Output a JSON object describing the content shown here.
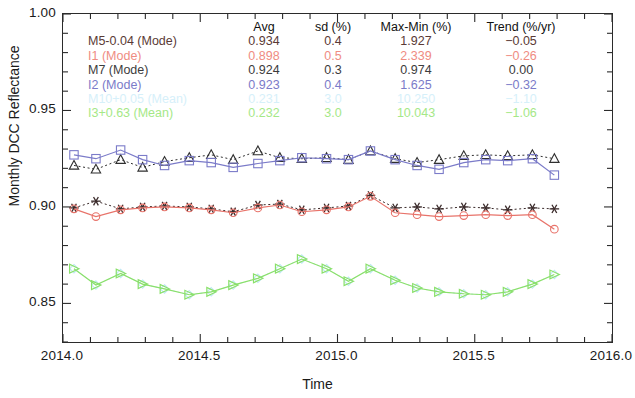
{
  "chart_data": {
    "type": "line",
    "title": "",
    "xlabel": "Time",
    "ylabel": "Monthly DCC Reflectance",
    "xlim": [
      2014.0,
      2016.0
    ],
    "ylim": [
      0.83,
      1.0
    ],
    "xticks": [
      "2014.0",
      "2014.5",
      "2015.0",
      "2015.5",
      "2016.0"
    ],
    "xtick_values": [
      2014.0,
      2014.5,
      2015.0,
      2015.5,
      2016.0
    ],
    "yticks": [
      "0.85",
      "0.90",
      "0.95",
      "1.00"
    ],
    "ytick_values": [
      0.85,
      0.9,
      0.95,
      1.0
    ],
    "grid": false,
    "legend_position": "top-center-inside",
    "series": [
      {
        "name": "M5-0.04 (Mode)",
        "color": "#3a2a2a",
        "marker": "asterisk",
        "linestyle": "dotted",
        "x": [
          2014.04,
          2014.12,
          2014.21,
          2014.29,
          2014.37,
          2014.46,
          2014.54,
          2014.62,
          2014.71,
          2014.79,
          2014.87,
          2014.96,
          2015.04,
          2015.12,
          2015.21,
          2015.29,
          2015.37,
          2015.46,
          2015.54,
          2015.62,
          2015.71,
          2015.79
        ],
        "y": [
          0.8995,
          0.903,
          0.899,
          0.9,
          0.9005,
          0.9,
          0.899,
          0.8975,
          0.901,
          0.9015,
          0.8985,
          0.8995,
          0.9005,
          0.906,
          0.8995,
          0.9,
          0.899,
          0.9,
          0.8995,
          0.8985,
          0.8995,
          0.899
        ]
      },
      {
        "name": "I1 (Mode)",
        "color": "#e8736a",
        "marker": "circle",
        "linestyle": "solid",
        "x": [
          2014.04,
          2014.12,
          2014.21,
          2014.29,
          2014.37,
          2014.46,
          2014.54,
          2014.62,
          2014.71,
          2014.79,
          2014.87,
          2014.96,
          2015.04,
          2015.12,
          2015.21,
          2015.29,
          2015.37,
          2015.46,
          2015.54,
          2015.62,
          2015.71,
          2015.79
        ],
        "y": [
          0.899,
          0.895,
          0.8985,
          0.8995,
          0.9,
          0.8995,
          0.8985,
          0.897,
          0.8995,
          0.901,
          0.8975,
          0.8985,
          0.9,
          0.9055,
          0.897,
          0.896,
          0.895,
          0.8955,
          0.896,
          0.8955,
          0.896,
          0.8885
        ]
      },
      {
        "name": "M7 (Mode)",
        "color": "#2f2f2f",
        "marker": "triangle-up",
        "linestyle": "dotted",
        "x": [
          2014.04,
          2014.12,
          2014.21,
          2014.29,
          2014.37,
          2014.46,
          2014.54,
          2014.62,
          2014.71,
          2014.79,
          2014.87,
          2014.96,
          2015.04,
          2015.12,
          2015.21,
          2015.29,
          2015.37,
          2015.46,
          2015.54,
          2015.62,
          2015.71,
          2015.79
        ],
        "y": [
          0.9215,
          0.9195,
          0.9245,
          0.9205,
          0.9235,
          0.9255,
          0.927,
          0.9245,
          0.929,
          0.9255,
          0.925,
          0.9255,
          0.9245,
          0.929,
          0.925,
          0.923,
          0.9245,
          0.9265,
          0.927,
          0.9265,
          0.927,
          0.925
        ]
      },
      {
        "name": "I2 (Mode)",
        "color": "#7b7bc9",
        "marker": "square",
        "linestyle": "solid",
        "x": [
          2014.04,
          2014.12,
          2014.21,
          2014.29,
          2014.37,
          2014.46,
          2014.54,
          2014.62,
          2014.71,
          2014.79,
          2014.87,
          2014.96,
          2015.04,
          2015.12,
          2015.21,
          2015.29,
          2015.37,
          2015.46,
          2015.54,
          2015.62,
          2015.71,
          2015.79
        ],
        "y": [
          0.927,
          0.925,
          0.9295,
          0.9245,
          0.9215,
          0.924,
          0.923,
          0.9205,
          0.9225,
          0.924,
          0.9255,
          0.925,
          0.9245,
          0.929,
          0.9245,
          0.9215,
          0.9195,
          0.923,
          0.9245,
          0.924,
          0.925,
          0.9165
        ]
      },
      {
        "name": "M10+0.05 (Mean)",
        "color": "#bfe8f5",
        "marker": "diamond",
        "linestyle": "dotted",
        "x": [
          2014.04,
          2014.12,
          2014.21,
          2014.29,
          2014.37,
          2014.46,
          2014.54,
          2014.62,
          2014.71,
          2014.79,
          2014.87,
          2014.96,
          2015.04,
          2015.12,
          2015.21,
          2015.29,
          2015.37,
          2015.46,
          2015.54,
          2015.62,
          2015.71,
          2015.79
        ],
        "y": [
          0.868,
          0.8595,
          0.8655,
          0.86,
          0.8575,
          0.8545,
          0.856,
          0.8595,
          0.863,
          0.868,
          0.873,
          0.868,
          0.8615,
          0.868,
          0.862,
          0.858,
          0.856,
          0.855,
          0.8545,
          0.856,
          0.86,
          0.865
        ]
      },
      {
        "name": "I3+0.63 (Mean)",
        "color": "#8ae06a",
        "marker": "triangle-right",
        "linestyle": "solid",
        "x": [
          2014.04,
          2014.12,
          2014.21,
          2014.29,
          2014.37,
          2014.46,
          2014.54,
          2014.62,
          2014.71,
          2014.79,
          2014.87,
          2014.96,
          2015.04,
          2015.12,
          2015.21,
          2015.29,
          2015.37,
          2015.46,
          2015.54,
          2015.62,
          2015.71,
          2015.79
        ],
        "y": [
          0.868,
          0.8595,
          0.8655,
          0.86,
          0.8575,
          0.8545,
          0.856,
          0.8595,
          0.863,
          0.868,
          0.873,
          0.868,
          0.8615,
          0.868,
          0.862,
          0.858,
          0.856,
          0.855,
          0.8545,
          0.856,
          0.86,
          0.865
        ]
      }
    ]
  },
  "legend": {
    "headers": {
      "name": "",
      "avg": "Avg",
      "sd": "sd (%)",
      "maxmin": "Max-Min (%)",
      "trend": "Trend (%/yr)"
    },
    "rows": [
      {
        "name": "M5-0.04 (Mode)",
        "avg": "0.934",
        "sd": "0.4",
        "maxmin": "1.927",
        "trend": "−0.05",
        "color": "#5a3a35"
      },
      {
        "name": "I1 (Mode)",
        "avg": "0.898",
        "sd": "0.5",
        "maxmin": "2.339",
        "trend": "−0.26",
        "color": "#ef8c82"
      },
      {
        "name": "M7 (Mode)",
        "avg": "0.924",
        "sd": "0.3",
        "maxmin": "0.974",
        "trend": "0.00",
        "color": "#3c3c3c"
      },
      {
        "name": "I2 (Mode)",
        "avg": "0.923",
        "sd": "0.4",
        "maxmin": "1.625",
        "trend": "−0.32",
        "color": "#7b7bc9"
      },
      {
        "name": "M10+0.05 (Mean)",
        "avg": "0.231",
        "sd": "3.0",
        "maxmin": "10.250",
        "trend": "−1.10",
        "color": "#d6f0fa"
      },
      {
        "name": "I3+0.63 (Mean)",
        "avg": "0.232",
        "sd": "3.0",
        "maxmin": "10.043",
        "trend": "−1.06",
        "color": "#a5e887"
      }
    ]
  },
  "axes": {
    "y_title": "Monthly DCC Reflectance",
    "x_title": "Time"
  }
}
